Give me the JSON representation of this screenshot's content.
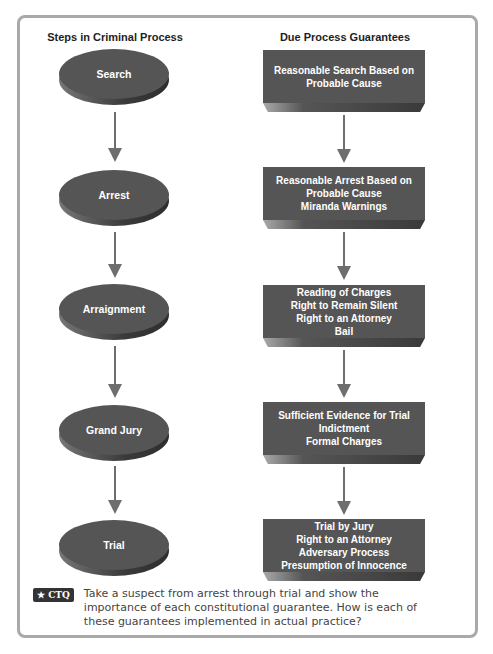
{
  "left_column": {
    "title": "Steps in Criminal Process",
    "steps": [
      "Search",
      "Arrest",
      "Arraignment",
      "Grand Jury",
      "Trial"
    ]
  },
  "right_column": {
    "title": "Due Process Guarantees",
    "guarantees": [
      [
        "Reasonable Search Based on",
        "Probable Cause"
      ],
      [
        "Reasonable Arrest Based on",
        "Probable Cause",
        "Miranda Warnings"
      ],
      [
        "Reading of Charges",
        "Right to Remain Silent",
        "Right to an Attorney",
        "Bail"
      ],
      [
        "Sufficient Evidence for Trial",
        "Indictment",
        "Formal Charges"
      ],
      [
        "Trial by Jury",
        "Right to an Attorney",
        "Adversary Process",
        "Presumption of Innocence"
      ]
    ]
  },
  "ctq": {
    "badge": "★ CTQ",
    "text": "Take a suspect from arrest through trial and show the importance of each constitutional guarantee. How is each of these guarantees implemented in actual practice?"
  }
}
